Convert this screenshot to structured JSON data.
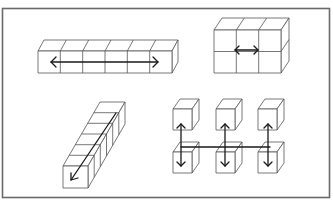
{
  "figure": {
    "colors": {
      "stroke": "#555555",
      "arrow": "#1a1a1a",
      "frame": "#6a6a6a",
      "background": "#ffffff"
    },
    "panels": [
      {
        "id": "row-of-cubes",
        "layout": "1x6 horizontal bar",
        "cube_count": 6,
        "arrow": "double-headed horizontal"
      },
      {
        "id": "block-of-cubes",
        "layout": "2x3 block",
        "cube_count": 6,
        "arrow": "double-headed horizontal (short)"
      },
      {
        "id": "depth-column",
        "layout": "6 cubes receding in depth",
        "cube_count": 6,
        "arrow": "single-headed diagonal toward viewer"
      },
      {
        "id": "separated-cubes",
        "layout": "2x3 grid of separated cubes",
        "cube_count": 6,
        "arrow": "three double-headed vertical arrows joined by horizontal line"
      }
    ]
  }
}
